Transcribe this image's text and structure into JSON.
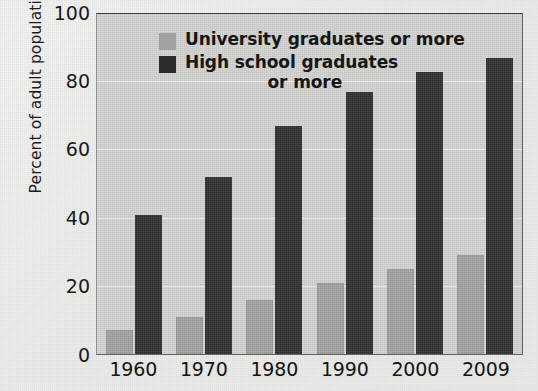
{
  "chart_data": {
    "type": "bar",
    "title": "",
    "xlabel": "",
    "ylabel": "Percent of adult population",
    "categories": [
      "1960",
      "1970",
      "1980",
      "1990",
      "2000",
      "2009"
    ],
    "series": [
      {
        "name": "University graduates or more",
        "color": "#a2a29f",
        "values": [
          7,
          11,
          16,
          21,
          25,
          29
        ]
      },
      {
        "name": "High school graduates or more",
        "color": "#2f2f2f",
        "values": [
          41,
          52,
          67,
          77,
          83,
          87
        ]
      }
    ],
    "ylim": [
      0,
      100
    ],
    "yticks": [
      100,
      80,
      60,
      40,
      20,
      0
    ],
    "ytick_labels": [
      "100",
      "80",
      "60",
      "40",
      "20",
      "0"
    ],
    "grid": true,
    "legend_position": "top-inside",
    "legend": {
      "series_1_label": "University graduates or more",
      "series_2_label_line1": "High school graduates",
      "series_2_label_line2": "or more"
    },
    "plot_background": "#d3d3d2"
  }
}
